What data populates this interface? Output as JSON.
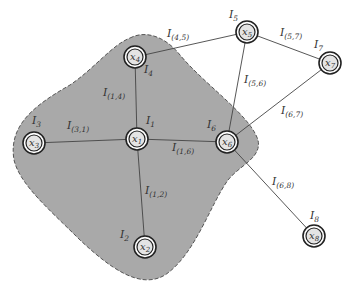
{
  "diagram": {
    "type": "graph",
    "region": {
      "fill": "#a9a9a9",
      "stroke": "#555555",
      "style": "dashed",
      "contains": [
        "x1",
        "x2",
        "x3",
        "x4",
        "x6"
      ]
    },
    "nodes": [
      {
        "id": "x1",
        "name": "x",
        "sub": "1",
        "label_name": "I",
        "label_sub": "1",
        "cx": 137,
        "cy": 139,
        "lx": 146,
        "ly": 124
      },
      {
        "id": "x2",
        "name": "x",
        "sub": "2",
        "label_name": "I",
        "label_sub": "2",
        "cx": 145,
        "cy": 247,
        "lx": 120,
        "ly": 238
      },
      {
        "id": "x3",
        "name": "x",
        "sub": "3",
        "label_name": "I",
        "label_sub": "3",
        "cx": 34,
        "cy": 143,
        "lx": 32,
        "ly": 124
      },
      {
        "id": "x4",
        "name": "x",
        "sub": "4",
        "label_name": "I",
        "label_sub": "4",
        "cx": 135,
        "cy": 57,
        "lx": 144,
        "ly": 73
      },
      {
        "id": "x5",
        "name": "x",
        "sub": "5",
        "label_name": "I",
        "label_sub": "5",
        "cx": 247,
        "cy": 32,
        "lx": 229,
        "ly": 18
      },
      {
        "id": "x6",
        "name": "x",
        "sub": "6",
        "label_name": "I",
        "label_sub": "6",
        "cx": 227,
        "cy": 142,
        "lx": 207,
        "ly": 128
      },
      {
        "id": "x7",
        "name": "x",
        "sub": "7",
        "label_name": "I",
        "label_sub": "7",
        "cx": 330,
        "cy": 63,
        "lx": 314,
        "ly": 48
      },
      {
        "id": "x8",
        "name": "x",
        "sub": "8",
        "label_name": "I",
        "label_sub": "8",
        "cx": 314,
        "cy": 236,
        "lx": 310,
        "ly": 219
      }
    ],
    "edges": [
      {
        "from": "x1",
        "to": "x4",
        "label_name": "I",
        "label_sub": "(1,4)",
        "lx": 103,
        "ly": 96
      },
      {
        "from": "x1",
        "to": "x3",
        "label_name": "I",
        "label_sub": "(3,1)",
        "lx": 67,
        "ly": 129
      },
      {
        "from": "x1",
        "to": "x6",
        "label_name": "I",
        "label_sub": "(1,6)",
        "lx": 172,
        "ly": 151
      },
      {
        "from": "x1",
        "to": "x2",
        "label_name": "I",
        "label_sub": "(1,2)",
        "lx": 145,
        "ly": 194
      },
      {
        "from": "x4",
        "to": "x5",
        "label_name": "I",
        "label_sub": "(4,5)",
        "lx": 167,
        "ly": 37
      },
      {
        "from": "x5",
        "to": "x6",
        "label_name": "I",
        "label_sub": "(5,6)",
        "lx": 244,
        "ly": 83
      },
      {
        "from": "x5",
        "to": "x7",
        "label_name": "I",
        "label_sub": "(5,7)",
        "lx": 280,
        "ly": 36
      },
      {
        "from": "x6",
        "to": "x7",
        "label_name": "I",
        "label_sub": "(6,7)",
        "lx": 281,
        "ly": 114
      },
      {
        "from": "x6",
        "to": "x8",
        "label_name": "I",
        "label_sub": "(6,8)",
        "lx": 272,
        "ly": 185
      }
    ]
  }
}
